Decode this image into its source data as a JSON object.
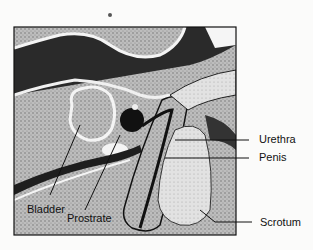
{
  "figure": {
    "type": "anatomical diagram",
    "labels": [
      {
        "id": "bladder",
        "text": "Bladder"
      },
      {
        "id": "prostrate",
        "text": "Prostrate"
      },
      {
        "id": "urethra",
        "text": "Urethra"
      },
      {
        "id": "penis",
        "text": "Penis"
      },
      {
        "id": "scrotum",
        "text": "Scrotum"
      }
    ]
  }
}
